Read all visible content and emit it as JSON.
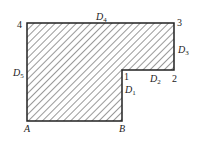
{
  "diagram": {
    "shape": {
      "points": "27,23 174,23 174,70 122,70 122,121 27,121",
      "fill_pattern": "diagonal-hatch",
      "stroke": "#222222"
    },
    "corner_labels": {
      "c1": "1",
      "c2": "2",
      "c3": "3",
      "c4": "4",
      "a": "A",
      "b": "B"
    },
    "edge_labels": {
      "d1": {
        "main": "D",
        "sub": "1"
      },
      "d2": {
        "main": "D",
        "sub": "2"
      },
      "d3": {
        "main": "D",
        "sub": "3"
      },
      "d4": {
        "main": "D",
        "sub": "4"
      },
      "d5": {
        "main": "D",
        "sub": "5"
      }
    }
  }
}
